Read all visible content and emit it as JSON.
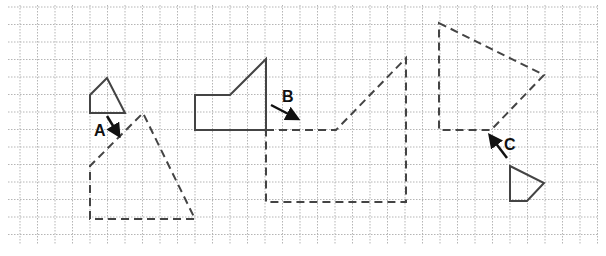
{
  "grid": {
    "x0": 20,
    "y0": 7,
    "step": 17.5,
    "cols": 33,
    "rows": 13,
    "left": 8,
    "right": 598,
    "top": 5,
    "bottom": 245,
    "color": "#b5b5b5"
  },
  "colors": {
    "shape": "#444444",
    "arrow": "#111111"
  },
  "shapes": [
    {
      "name": "A",
      "original": [
        [
          90,
          113
        ],
        [
          90,
          95
        ],
        [
          107,
          78
        ],
        [
          125,
          113
        ]
      ],
      "image": [
        [
          90,
          219
        ],
        [
          90,
          166
        ],
        [
          143,
          113
        ],
        [
          195,
          219
        ]
      ],
      "arrow": {
        "from": [
          107,
          116
        ],
        "to": [
          118,
          134
        ]
      },
      "label": {
        "text": "A",
        "x": 94,
        "y": 136
      }
    },
    {
      "name": "B",
      "original": [
        [
          195,
          130
        ],
        [
          195,
          95
        ],
        [
          230,
          95
        ],
        [
          266,
          59
        ],
        [
          266,
          130
        ]
      ],
      "image": [
        [
          266,
          130
        ],
        [
          336,
          130
        ],
        [
          406,
          58
        ],
        [
          406,
          202
        ],
        [
          266,
          202
        ]
      ],
      "arrow": {
        "from": [
          271,
          105
        ],
        "to": [
          296,
          118
        ]
      },
      "label": {
        "text": "B",
        "x": 282,
        "y": 102
      }
    },
    {
      "name": "C",
      "original": [
        [
          510,
          166
        ],
        [
          544,
          183
        ],
        [
          527,
          201
        ],
        [
          510,
          201
        ]
      ],
      "image": [
        [
          439,
          23
        ],
        [
          544,
          75
        ],
        [
          491,
          130
        ],
        [
          439,
          130
        ]
      ],
      "arrow": {
        "from": [
          507,
          158
        ],
        "to": [
          491,
          137
        ]
      },
      "label": {
        "text": "C",
        "x": 504,
        "y": 150
      }
    }
  ]
}
